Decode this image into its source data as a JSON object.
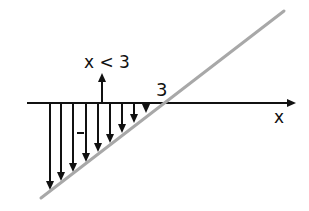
{
  "diagram": {
    "condition_label": "x < 3",
    "root_label": "3",
    "axis_label": "x",
    "sign_label": "-",
    "colors": {
      "axis": "#111111",
      "line": "#a8a8a8",
      "arrows": "#111111"
    },
    "arrows_x": [
      50,
      61,
      73,
      86,
      98,
      110,
      122,
      134,
      146
    ]
  }
}
